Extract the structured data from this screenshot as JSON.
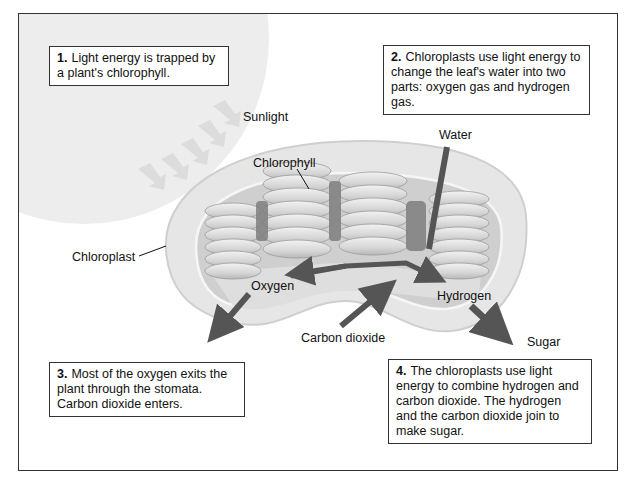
{
  "diagram": {
    "type": "photosynthesis-chloroplast",
    "steps": [
      {
        "number": "1.",
        "text": "Light energy is trapped by a plant's chlorophyll."
      },
      {
        "number": "2.",
        "text": "Chloroplasts use light energy to change the leaf's water into two parts: oxygen gas and hydrogen gas."
      },
      {
        "number": "3.",
        "text": "Most of the oxygen exits the plant through the stomata. Carbon dioxide enters."
      },
      {
        "number": "4.",
        "text": "The chloroplasts use light energy to combine hydrogen and carbon dioxide. The hydrogen and the carbon dioxide join to make sugar."
      }
    ],
    "labels": {
      "sunlight": "Sunlight",
      "chlorophyll": "Chlorophyll",
      "water": "Water",
      "chloroplast": "Chloroplast",
      "oxygen": "Oxygen",
      "hydrogen": "Hydrogen",
      "carbon_dioxide": "Carbon dioxide",
      "sugar": "Sugar"
    },
    "colors": {
      "sun": "#ededed",
      "membrane": "#e2e2e2",
      "grana": "#d4d4d4",
      "arrow": "#555555",
      "border": "#333333"
    }
  }
}
